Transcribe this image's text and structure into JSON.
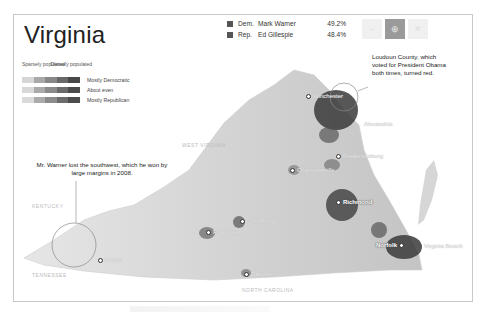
{
  "title": "Virginia",
  "legend": {
    "sparse_label": "Sparsely populated",
    "dense_label": "Densely populated",
    "rows": [
      {
        "label": "Mostly Democratic",
        "colors": [
          "#d8d8d8",
          "#a9a9a9",
          "#8a8a8a",
          "#6a6a6a",
          "#4a4a4a"
        ]
      },
      {
        "label": "About even",
        "colors": [
          "#dadada",
          "#b0b0b0",
          "#8e8e8e",
          "#6e6e6e",
          "#4e4e4e"
        ]
      },
      {
        "label": "Mostly Republican",
        "colors": [
          "#dcdcdc",
          "#ababab",
          "#8c8c8c",
          "#6c6c6c",
          "#4c4c4c"
        ]
      }
    ]
  },
  "results": [
    {
      "party": "Dem.",
      "candidate": "Mark Warner",
      "pct": "49.2%"
    },
    {
      "party": "Rep.",
      "candidate": "Ed Gillespie",
      "pct": "48.4%"
    }
  ],
  "zoom_buttons": [
    {
      "name": "zoom-out",
      "glyph": "−",
      "active": false
    },
    {
      "name": "zoom-in",
      "glyph": "⊕",
      "active": true
    },
    {
      "name": "reset",
      "glyph": "✕",
      "active": false
    }
  ],
  "annotations": {
    "loudoun": "Loudoun County, which voted for President Obama both times, turned red.",
    "southwest": "Mr. Warner lost the southwest, which he won by large margins in 2008."
  },
  "state_labels": {
    "west_virginia": "WEST VIRGINIA",
    "kentucky": "KENTUCKY",
    "tennessee": "TENNESSEE",
    "north_carolina": "NORTH CAROLINA"
  },
  "cities": [
    {
      "name": "Winchester"
    },
    {
      "name": "Alexandria"
    },
    {
      "name": "Fredericksburg"
    },
    {
      "name": "Charlottesville"
    },
    {
      "name": "Richmond"
    },
    {
      "name": "Lynchburg"
    },
    {
      "name": "Roanoke"
    },
    {
      "name": "Danville"
    },
    {
      "name": "Bristol"
    },
    {
      "name": "Norfolk"
    },
    {
      "name": "Virginia Beach"
    }
  ]
}
